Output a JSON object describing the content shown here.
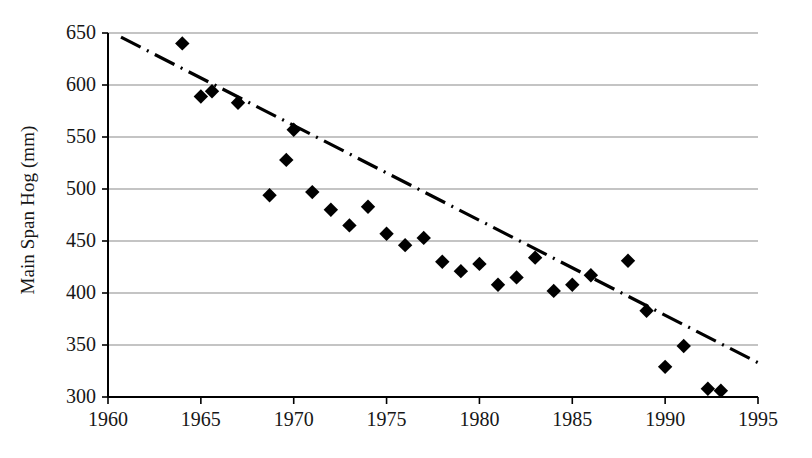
{
  "chart_data": {
    "type": "scatter",
    "title": "",
    "xlabel": "",
    "ylabel": "Main Span Hog (mm)",
    "xlim": [
      1960,
      1995
    ],
    "ylim": [
      300,
      650
    ],
    "grid": "horizontal",
    "legend": "none",
    "xticks": [
      1960,
      1965,
      1970,
      1975,
      1980,
      1985,
      1990,
      1995
    ],
    "xtick_labels": [
      "1960",
      "1965",
      "1970",
      "1975",
      "1980",
      "1985",
      "1990",
      "1995"
    ],
    "yticks": [
      300,
      350,
      400,
      450,
      500,
      550,
      600,
      650
    ],
    "ytick_labels": [
      "300",
      "350",
      "400",
      "450",
      "500",
      "550",
      "600",
      "650"
    ],
    "marker": "filled-diamond",
    "marker_color": "#000000",
    "gridline_color": "#8a8a8a",
    "axis_color": "#000000",
    "trendline": {
      "style": "dash-dot",
      "color": "#000000",
      "x_start": 1960.7,
      "y_start": 646,
      "x_end": 1995.0,
      "y_end": 333
    },
    "series": [
      {
        "name": "Main Span Hog",
        "points": [
          {
            "x": 1964,
            "y": 640
          },
          {
            "x": 1965,
            "y": 589
          },
          {
            "x": 1965.6,
            "y": 594
          },
          {
            "x": 1967,
            "y": 583
          },
          {
            "x": 1968.7,
            "y": 494
          },
          {
            "x": 1970,
            "y": 557
          },
          {
            "x": 1969.6,
            "y": 528
          },
          {
            "x": 1971,
            "y": 497
          },
          {
            "x": 1972,
            "y": 480
          },
          {
            "x": 1973,
            "y": 465
          },
          {
            "x": 1974,
            "y": 483
          },
          {
            "x": 1975,
            "y": 457
          },
          {
            "x": 1976,
            "y": 446
          },
          {
            "x": 1977,
            "y": 453
          },
          {
            "x": 1978,
            "y": 430
          },
          {
            "x": 1979,
            "y": 421
          },
          {
            "x": 1980,
            "y": 428
          },
          {
            "x": 1981,
            "y": 408
          },
          {
            "x": 1982,
            "y": 415
          },
          {
            "x": 1983,
            "y": 434
          },
          {
            "x": 1984,
            "y": 402
          },
          {
            "x": 1985,
            "y": 408
          },
          {
            "x": 1986,
            "y": 417
          },
          {
            "x": 1988,
            "y": 431
          },
          {
            "x": 1989,
            "y": 383
          },
          {
            "x": 1990,
            "y": 329
          },
          {
            "x": 1991,
            "y": 349
          },
          {
            "x": 1992.3,
            "y": 308
          },
          {
            "x": 1993,
            "y": 306
          }
        ]
      }
    ]
  }
}
